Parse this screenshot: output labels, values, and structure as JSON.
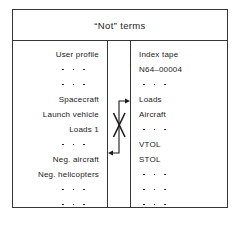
{
  "figure": {
    "title": "“Not” terms",
    "frame_color": "#33373a",
    "background": "#ffffff"
  },
  "columns": {
    "left": {
      "name": "user-profile-column",
      "rows": [
        {
          "type": "text",
          "label": "User profile"
        },
        {
          "type": "ellipsis",
          "label": "• • •"
        },
        {
          "type": "ellipsis",
          "label": "• • •"
        },
        {
          "type": "text",
          "label": "Spacecraft"
        },
        {
          "type": "text",
          "label": "Launch vehicle"
        },
        {
          "type": "text",
          "label": "Loads 1"
        },
        {
          "type": "ellipsis",
          "label": "• • •"
        },
        {
          "type": "text",
          "label": "Neg. aircraft"
        },
        {
          "type": "text",
          "label": "Neg. helicopters"
        },
        {
          "type": "ellipsis",
          "label": "• • •"
        },
        {
          "type": "ellipsis",
          "label": "• • •"
        }
      ]
    },
    "right": {
      "name": "index-tape-column",
      "rows": [
        {
          "type": "text",
          "label": "Index tape"
        },
        {
          "type": "text",
          "label": "N64–00004"
        },
        {
          "type": "ellipsis",
          "label": "• • •"
        },
        {
          "type": "text",
          "label": "Loads"
        },
        {
          "type": "text",
          "label": "Aircraft"
        },
        {
          "type": "ellipsis",
          "label": "• • •"
        },
        {
          "type": "text",
          "label": "VTOL"
        },
        {
          "type": "text",
          "label": "STOL"
        },
        {
          "type": "ellipsis",
          "label": "• • •"
        },
        {
          "type": "ellipsis",
          "label": "• • •"
        },
        {
          "type": "ellipsis",
          "label": "• • •"
        }
      ]
    }
  },
  "connector": {
    "name": "crossed-arrows",
    "description": "X of two crossing strokes with one arrow pointing up-right into the right column and one arrow pointing down-left into the left column",
    "stroke_color": "#1b1b1b"
  }
}
